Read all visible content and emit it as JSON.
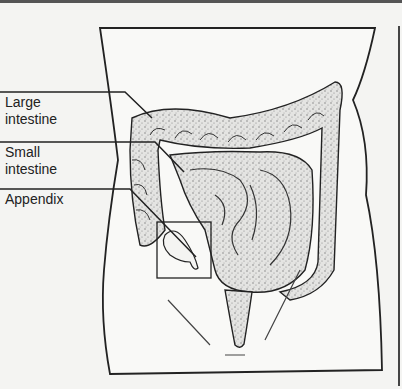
{
  "figure": {
    "labels": [
      {
        "id": "large-intestine",
        "line1": "Large",
        "line2": "intestine"
      },
      {
        "id": "small-intestine",
        "line1": "Small",
        "line2": "intestine"
      },
      {
        "id": "appendix",
        "line1": "Appendix",
        "line2": ""
      }
    ]
  },
  "colors": {
    "ink": "#222222",
    "paper": "#f4f4f2",
    "stipple": "#bdbdbd"
  }
}
